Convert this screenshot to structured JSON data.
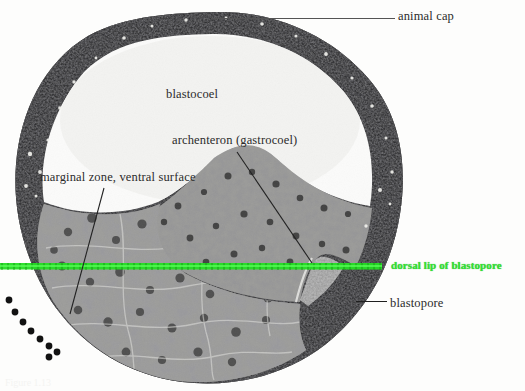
{
  "figure": {
    "caption_ghost": "Figure 1.13",
    "background_color": "#fdfdfc"
  },
  "labels": {
    "animal_cap": "animal cap",
    "blastocoel": "blastocoel",
    "archenteron": "archenteron (gastrocoel)",
    "marginal_zone": "marginal zone, ventral surface",
    "dorsal_lip": "dorsal lip of blastopore",
    "blastopore": "blastopore"
  },
  "annotation_colors": {
    "label_text": "#2b2b2b",
    "dorsal_lip_text": "#32e032",
    "green_line": "#22dd22",
    "leader_line": "#3a3a3a",
    "dotted_arc": "#111111"
  },
  "icons": {
    "leader_animal_cap": "horizontal-leader-line-icon",
    "leader_archenteron": "diagonal-leader-line-icon",
    "leader_marginal_zone": "diagonal-leader-line-icon",
    "leader_blastopore": "horizontal-leader-line-icon",
    "dorsal_lip_marker": "green-horizontal-rule-icon",
    "ventral_marker": "dotted-arc-icon"
  },
  "specimen": {
    "structures": [
      "animal cap",
      "blastocoel",
      "archenteron (gastrocoel)",
      "marginal zone, ventral surface",
      "dorsal lip of blastopore",
      "blastopore"
    ],
    "dotted_arc_dot_count": 9
  }
}
